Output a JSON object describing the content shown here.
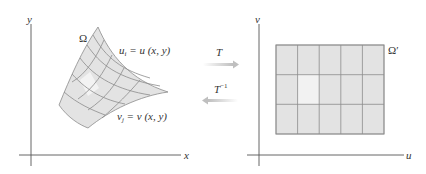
{
  "diagram": {
    "left_panel": {
      "x_axis_label": "x",
      "y_axis_label": "y",
      "domain_label": "Ω",
      "u_line_label": {
        "var": "u",
        "sub": "i",
        "rest": " = u (x, y)"
      },
      "v_line_label": {
        "var": "v",
        "sub": "j",
        "rest": " = v (x, y)"
      },
      "mesh": {
        "rows": 4,
        "cols": 5,
        "highlight_cell": [
          2,
          1
        ]
      }
    },
    "right_panel": {
      "x_axis_label": "u",
      "y_axis_label": "v",
      "domain_label": "Ω′",
      "grid": {
        "rows": 3,
        "cols": 5,
        "highlight_cell": [
          1,
          1
        ]
      }
    },
    "arrows": {
      "forward_label": "T",
      "inverse_label": "T",
      "inverse_exponent": "−1"
    },
    "colors": {
      "fill": "#e3e3e3",
      "highlight": "#f2f2f2",
      "grid_line": "#8c8c8c",
      "axis": "#555555",
      "arrow": "#c8c8c8"
    }
  }
}
